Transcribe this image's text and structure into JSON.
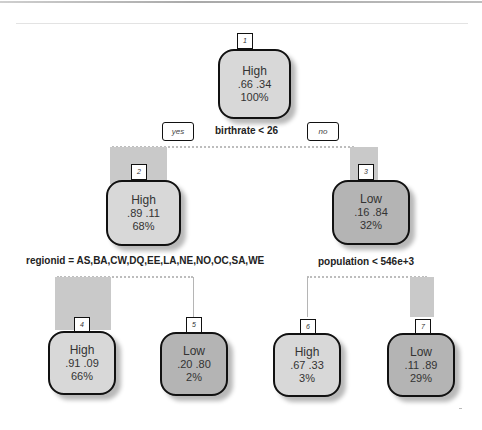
{
  "tree": {
    "root_split": {
      "label": "birthrate < 26",
      "yes_label": "yes",
      "no_label": "no"
    },
    "left_split": {
      "label": "regionid = AS,BA,CW,DQ,EE,LA,NE,NO,OC,SA,WE"
    },
    "right_split": {
      "label": "population < 546e+3"
    },
    "nodes": [
      {
        "id": "1",
        "class": "High",
        "probs": ".66  .34",
        "percent": "100%"
      },
      {
        "id": "2",
        "class": "High",
        "probs": ".89  .11",
        "percent": "68%"
      },
      {
        "id": "3",
        "class": "Low",
        "probs": ".16  .84",
        "percent": "32%"
      },
      {
        "id": "4",
        "class": "High",
        "probs": ".91  .09",
        "percent": "66%"
      },
      {
        "id": "5",
        "class": "Low",
        "probs": ".20  .80",
        "percent": "2%"
      },
      {
        "id": "6",
        "class": "High",
        "probs": ".67  .33",
        "percent": "3%"
      },
      {
        "id": "7",
        "class": "Low",
        "probs": ".11  .89",
        "percent": "29%"
      }
    ]
  },
  "colors": {
    "high_fill": "#d8d8d8",
    "low_fill": "#b4b4b4",
    "branch_bar": "#c9c9c9",
    "border": "#111111"
  }
}
